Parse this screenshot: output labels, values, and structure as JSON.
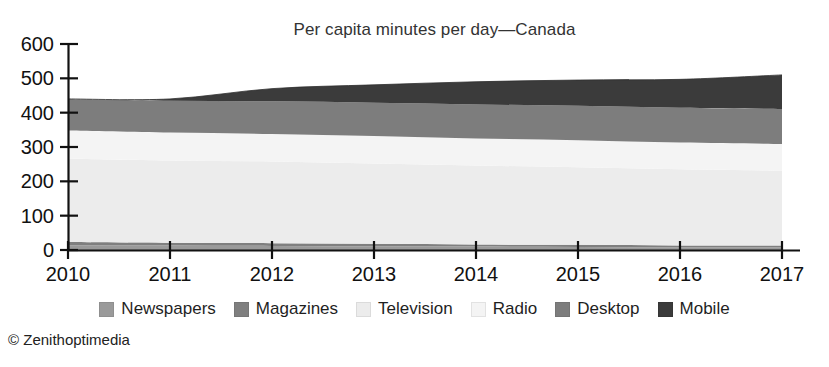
{
  "chart_data": {
    "type": "area",
    "title": "Per capita minutes per day—Canada",
    "xlabel": "",
    "ylabel": "",
    "stacked": true,
    "grid": false,
    "legend_position": "bottom",
    "x": [
      2010,
      2011,
      2012,
      2013,
      2014,
      2015,
      2016,
      2017
    ],
    "categories": [
      "2010",
      "2011",
      "2012",
      "2013",
      "2014",
      "2015",
      "2016",
      "2017"
    ],
    "xlim": [
      2010,
      2017
    ],
    "ylim": [
      0,
      600
    ],
    "yticks": [
      0,
      100,
      200,
      300,
      400,
      500,
      600
    ],
    "ytick_labels": [
      "0",
      "100",
      "200",
      "300",
      "400",
      "500",
      "600"
    ],
    "series": [
      {
        "name": "Newspapers",
        "color": "#9a9a9a",
        "values": [
          14,
          13,
          12,
          11,
          10,
          9,
          8,
          8
        ]
      },
      {
        "name": "Magazines",
        "color": "#7f7f7f",
        "values": [
          9,
          8,
          8,
          7,
          6,
          6,
          5,
          5
        ]
      },
      {
        "name": "Television",
        "color": "#ececec",
        "values": [
          243,
          240,
          238,
          234,
          230,
          226,
          222,
          218
        ]
      },
      {
        "name": "Radio",
        "color": "#f4f4f4",
        "values": [
          82,
          81,
          80,
          80,
          79,
          79,
          78,
          78
        ]
      },
      {
        "name": "Desktop",
        "color": "#7d7d7d",
        "values": [
          92,
          93,
          95,
          97,
          99,
          100,
          101,
          102
        ]
      },
      {
        "name": "Mobile",
        "color": "#3b3b3b",
        "values": [
          0,
          5,
          37,
          52,
          66,
          75,
          83,
          99
        ]
      }
    ],
    "totals": [
      440,
      440,
      470,
      481,
      490,
      495,
      497,
      510
    ],
    "annotations": [
      "© Zenithoptimedia"
    ]
  },
  "legend": {
    "items": [
      {
        "label": "Newspapers",
        "swatch": "#9a9a9a"
      },
      {
        "label": "Magazines",
        "swatch": "#7f7f7f"
      },
      {
        "label": "Television",
        "swatch": "#ececec"
      },
      {
        "label": "Radio",
        "swatch": "#f4f4f4"
      },
      {
        "label": "Desktop",
        "swatch": "#7d7d7d"
      },
      {
        "label": "Mobile",
        "swatch": "#3b3b3b"
      }
    ]
  },
  "credit": {
    "text": "© Zenithoptimedia"
  },
  "axis": {
    "color": "#111111"
  }
}
